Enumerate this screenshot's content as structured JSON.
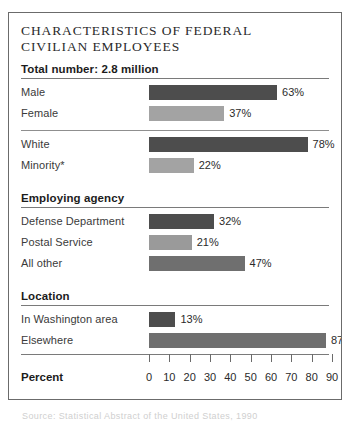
{
  "chart_data": {
    "type": "bar",
    "title": "CHARACTERISTICS OF FEDERAL\nCIVILIAN EMPLOYEES",
    "xlabel": "Percent",
    "ylabel": "",
    "xlim": [
      0,
      90
    ],
    "xticks": [
      0,
      10,
      20,
      30,
      40,
      50,
      60,
      70,
      80,
      90
    ],
    "grid": false,
    "legend": "none",
    "orientation": "horizontal",
    "sections": [
      {
        "header": "Total number: 2.8 million",
        "groups": [
          {
            "bars": [
              {
                "label": "Male",
                "value": 63,
                "value_label": "63%",
                "tone": "t-dark"
              },
              {
                "label": "Female",
                "value": 37,
                "value_label": "37%",
                "tone": "t-light"
              }
            ]
          },
          {
            "bars": [
              {
                "label": "White",
                "value": 78,
                "value_label": "78%",
                "tone": "t-dark"
              },
              {
                "label": "Minority*",
                "value": 22,
                "value_label": "22%",
                "tone": "t-light"
              }
            ]
          }
        ]
      },
      {
        "header": "Employing agency",
        "groups": [
          {
            "bars": [
              {
                "label": "Defense Department",
                "value": 32,
                "value_label": "32%",
                "tone": "t-dark"
              },
              {
                "label": "Postal Service",
                "value": 21,
                "value_label": "21%",
                "tone": "t-midlt"
              },
              {
                "label": "All other",
                "value": 47,
                "value_label": "47%",
                "tone": "t-mid"
              }
            ]
          }
        ]
      },
      {
        "header": "Location",
        "groups": [
          {
            "bars": [
              {
                "label": "In Washington area",
                "value": 13,
                "value_label": "13%",
                "tone": "t-dark"
              },
              {
                "label": "Elsewhere",
                "value": 87,
                "value_label": "87%",
                "tone": "t-mid"
              }
            ]
          }
        ]
      }
    ]
  },
  "footer": {
    "percent_label": "Percent",
    "source": "Source: Statistical Abstract of the United States, 1990"
  },
  "colors": {
    "bar_dark": "#4d4d4d",
    "bar_mid": "#6f6f6f",
    "bar_midlight": "#9a9a9a",
    "bar_light": "#a3a3a3",
    "rule": "#7a7a7a",
    "border": "#6b6b6b",
    "text": "#2b2b2b"
  }
}
